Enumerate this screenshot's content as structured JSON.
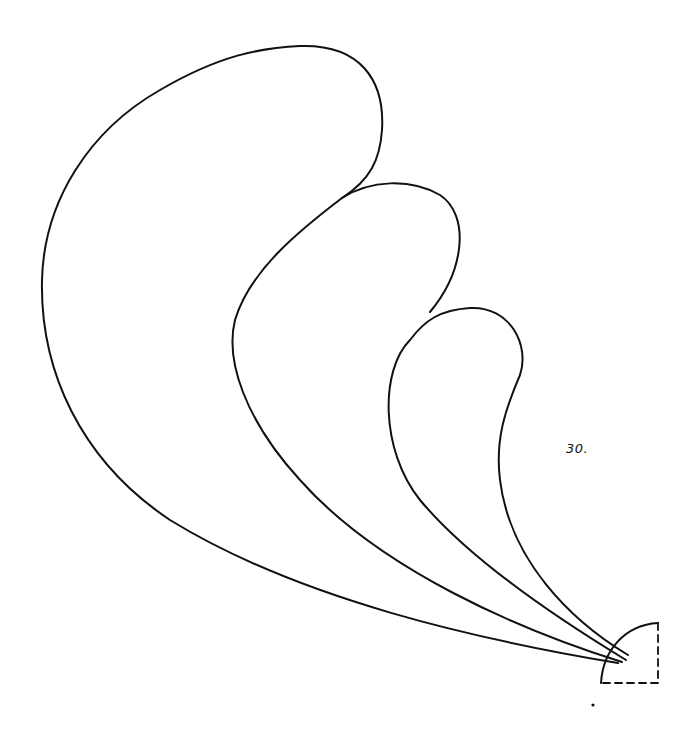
{
  "diagram": {
    "page_label": "30.",
    "stroke_color": "#111111",
    "background_color": "#ffffff",
    "shapes": [
      {
        "name": "large-plume"
      },
      {
        "name": "medium-plume"
      },
      {
        "name": "small-plume"
      },
      {
        "name": "quarter-circle-base",
        "edge_style": "dashed"
      }
    ]
  }
}
